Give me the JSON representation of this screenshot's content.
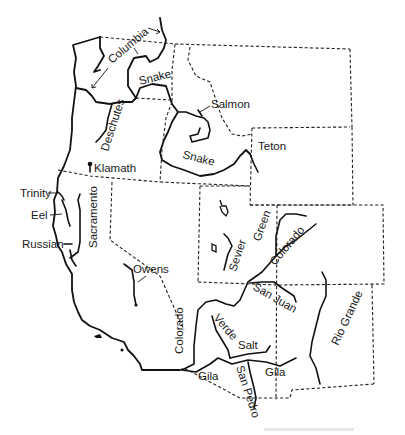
{
  "map": {
    "title": "Rivers of the Western United States",
    "labels": {
      "columbia": "Columbia",
      "snake_north": "Snake",
      "salmon": "Salmon",
      "deschutes": "Deschutes",
      "snake_south": "Snake",
      "teton": "Teton",
      "klamath": "Klamath",
      "trinity": "Trinity",
      "eel": "Eel",
      "russian": "Russian",
      "sacramento": "Sacramento",
      "owens": "Owens",
      "sevier": "Sevier",
      "green": "Green",
      "colorado_upper": "Colorado",
      "san_juan": "San Juan",
      "colorado_lower": "Colorado",
      "verde": "Verde",
      "salt": "Salt",
      "gila_west": "Gila",
      "gila_east": "Gila",
      "san_pedro": "San Pedro",
      "rio_grande": "Rio Grande"
    }
  }
}
